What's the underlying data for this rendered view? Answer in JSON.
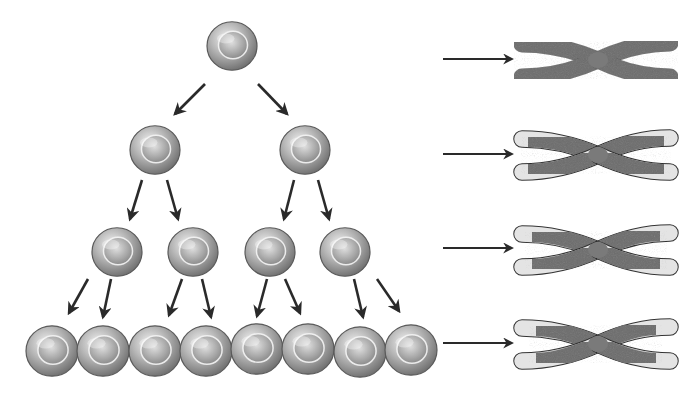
{
  "diagram": {
    "colors": {
      "background": "#ffffff",
      "arrow": "#2a2a2a",
      "cell_dark": "#6e6e6e",
      "cell_light": "#e6e6e6",
      "chromosome": "#7a7a7a",
      "telomere_cap": "#e4e4e4"
    },
    "generations": [
      {
        "index": 0,
        "cell_count": 1,
        "cells": [
          {
            "cx": 232,
            "cy": 46,
            "r": 25
          }
        ]
      },
      {
        "index": 1,
        "cell_count": 2,
        "cells": [
          {
            "cx": 155,
            "cy": 150,
            "r": 25
          },
          {
            "cx": 305,
            "cy": 150,
            "r": 25
          }
        ]
      },
      {
        "index": 2,
        "cell_count": 4,
        "cells": [
          {
            "cx": 117,
            "cy": 252,
            "r": 25
          },
          {
            "cx": 193,
            "cy": 252,
            "r": 25
          },
          {
            "cx": 270,
            "cy": 252,
            "r": 25
          },
          {
            "cx": 345,
            "cy": 252,
            "r": 25
          }
        ]
      },
      {
        "index": 3,
        "cell_count": 8,
        "cells": [
          {
            "cx": 52,
            "cy": 351,
            "r": 26
          },
          {
            "cx": 103,
            "cy": 351,
            "r": 26
          },
          {
            "cx": 155,
            "cy": 351,
            "r": 26
          },
          {
            "cx": 206,
            "cy": 351,
            "r": 26
          },
          {
            "cx": 257,
            "cy": 349,
            "r": 26
          },
          {
            "cx": 308,
            "cy": 349,
            "r": 26
          },
          {
            "cx": 360,
            "cy": 352,
            "r": 26
          },
          {
            "cx": 411,
            "cy": 350,
            "r": 26
          }
        ]
      }
    ],
    "division_arrows": [
      {
        "x1": 205,
        "y1": 84,
        "x2": 175,
        "y2": 114
      },
      {
        "x1": 258,
        "y1": 84,
        "x2": 287,
        "y2": 114
      },
      {
        "x1": 142,
        "y1": 180,
        "x2": 130,
        "y2": 219
      },
      {
        "x1": 167,
        "y1": 180,
        "x2": 178,
        "y2": 219
      },
      {
        "x1": 294,
        "y1": 180,
        "x2": 284,
        "y2": 219
      },
      {
        "x1": 318,
        "y1": 180,
        "x2": 329,
        "y2": 219
      },
      {
        "x1": 88,
        "y1": 279,
        "x2": 69,
        "y2": 313
      },
      {
        "x1": 111,
        "y1": 279,
        "x2": 103,
        "y2": 317
      },
      {
        "x1": 182,
        "y1": 279,
        "x2": 169,
        "y2": 315
      },
      {
        "x1": 202,
        "y1": 279,
        "x2": 211,
        "y2": 317
      },
      {
        "x1": 267,
        "y1": 279,
        "x2": 257,
        "y2": 316
      },
      {
        "x1": 285,
        "y1": 279,
        "x2": 300,
        "y2": 313
      },
      {
        "x1": 354,
        "y1": 279,
        "x2": 363,
        "y2": 317
      },
      {
        "x1": 377,
        "y1": 279,
        "x2": 399,
        "y2": 311
      }
    ],
    "chromosome_arrows": [
      {
        "x1": 443,
        "y1": 59,
        "x2": 512,
        "y2": 59
      },
      {
        "x1": 443,
        "y1": 154,
        "x2": 512,
        "y2": 154
      },
      {
        "x1": 443,
        "y1": 248,
        "x2": 512,
        "y2": 248
      },
      {
        "x1": 443,
        "y1": 343,
        "x2": 512,
        "y2": 343
      }
    ],
    "chromosomes": [
      {
        "generation": 0,
        "cy": 60,
        "telomere_length": 0
      },
      {
        "generation": 1,
        "cy": 155,
        "telomere_length": 6
      },
      {
        "generation": 2,
        "cy": 250,
        "telomere_length": 10
      },
      {
        "generation": 3,
        "cy": 344,
        "telomere_length": 14
      }
    ]
  }
}
